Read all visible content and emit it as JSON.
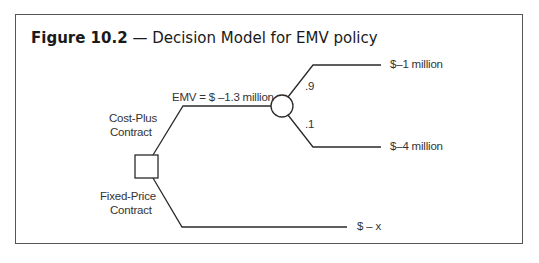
{
  "figure": {
    "number": "Figure 10.2",
    "separator": "—",
    "title": "Decision Model for EMV policy"
  },
  "decision_node": {
    "type": "decision",
    "shape": "square"
  },
  "branches": {
    "cost_plus": {
      "label_line1": "Cost-Plus",
      "label_line2": "Contract",
      "emv_label": "EMV = $ –1.3 million"
    },
    "fixed_price": {
      "label_line1": "Fixed-Price",
      "label_line2": "Contract",
      "outcome": "$ – x"
    }
  },
  "chance_node": {
    "type": "chance",
    "shape": "circle",
    "outcomes": [
      {
        "probability": ".9",
        "value": "$–1 million"
      },
      {
        "probability": ".1",
        "value": "$–4 million"
      }
    ]
  },
  "colors": {
    "line": "#2a2a2a",
    "frame": "#555555",
    "text": "#333333"
  }
}
